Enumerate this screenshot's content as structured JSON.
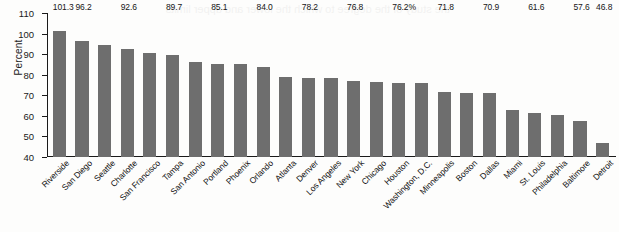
{
  "chart_data": {
    "type": "bar",
    "title": "",
    "xlabel": "",
    "ylabel": "Percent",
    "ylim": [
      40,
      110
    ],
    "yticks": [
      40,
      50,
      60,
      70,
      80,
      90,
      100,
      110
    ],
    "grid": false,
    "legend": null,
    "orientation": "vertical",
    "bar_color": "#6e6e6e",
    "categories": [
      "Riverside",
      "San Diego",
      "Seattle",
      "Charlotte",
      "San Francisco",
      "Tampa",
      "San Antonio",
      "Portland",
      "Phoenix",
      "Orlando",
      "Atlanta",
      "Denver",
      "Los Angeles",
      "New York",
      "Chicago",
      "Houston",
      "Washington, D.C.",
      "Minneapolis",
      "Boston",
      "Dallas",
      "Miami",
      "St. Louis",
      "Philadelphia",
      "Baltimore",
      "Detroit"
    ],
    "values": [
      101.3,
      96.2,
      94.6,
      92.6,
      90.8,
      89.7,
      86.0,
      85.1,
      85.0,
      84.0,
      79.0,
      78.2,
      78.3,
      76.8,
      76.5,
      76.2,
      76.0,
      71.8,
      71.0,
      70.9,
      63.0,
      61.6,
      60.5,
      57.6,
      46.8
    ],
    "point_labels": [
      "101.3",
      "96.2",
      "",
      "92.6",
      "",
      "89.7",
      "",
      "85.1",
      "",
      "84.0",
      "",
      "78.2",
      "",
      "76.8",
      "",
      "76.2%",
      "",
      "71.8",
      "",
      "70.9",
      "",
      "61.6",
      "",
      "57.6",
      "46.8"
    ]
  },
  "bleed_text": "the study of the degree to which the lower and upper limits"
}
